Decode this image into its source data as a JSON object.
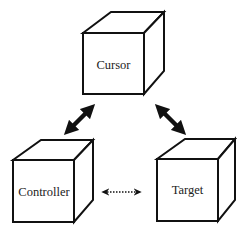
{
  "diagram": {
    "nodes": [
      {
        "id": "cursor",
        "label": "Cursor"
      },
      {
        "id": "controller",
        "label": "Controller"
      },
      {
        "id": "target",
        "label": "Target"
      }
    ],
    "edges": [
      {
        "from": "controller",
        "to": "cursor",
        "style": "solid-bold",
        "direction": "bidirectional"
      },
      {
        "from": "cursor",
        "to": "target",
        "style": "solid-bold",
        "direction": "bidirectional"
      },
      {
        "from": "controller",
        "to": "target",
        "style": "dotted",
        "direction": "bidirectional"
      }
    ],
    "colors": {
      "stroke": "#111111",
      "background": "#ffffff",
      "text": "#222222"
    }
  }
}
